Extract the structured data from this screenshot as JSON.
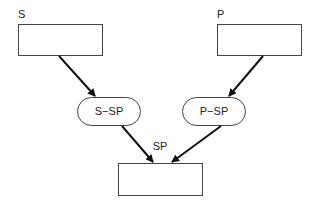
{
  "diagram": {
    "nodes": [
      {
        "id": "S",
        "label": "S",
        "shape": "rectangle",
        "x": 18,
        "y": 24,
        "w": 84,
        "h": 31,
        "label_pos": "above-left"
      },
      {
        "id": "P",
        "label": "P",
        "shape": "rectangle",
        "x": 217,
        "y": 24,
        "w": 84,
        "h": 31,
        "label_pos": "above-left"
      },
      {
        "id": "S-SP",
        "label": "S−SP",
        "shape": "rounded",
        "x": 77,
        "y": 97,
        "w": 63,
        "h": 28
      },
      {
        "id": "P-SP",
        "label": "P−SP",
        "shape": "rounded",
        "x": 182,
        "y": 97,
        "w": 63,
        "h": 28
      },
      {
        "id": "SP",
        "label": "SP",
        "shape": "rectangle",
        "x": 118,
        "y": 163,
        "w": 84,
        "h": 32,
        "label_pos": "above-center"
      }
    ],
    "edges": [
      {
        "from": "S",
        "to": "S-SP"
      },
      {
        "from": "P",
        "to": "P-SP"
      },
      {
        "from": "S-SP",
        "to": "SP"
      },
      {
        "from": "P-SP",
        "to": "SP"
      }
    ],
    "colors": {
      "stroke": "#222222",
      "arrow": "#111111",
      "background": "#ffffff"
    }
  }
}
